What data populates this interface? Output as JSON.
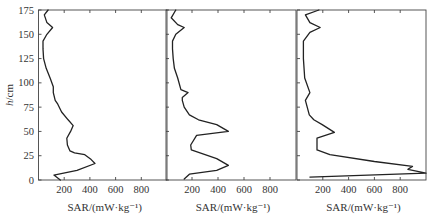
{
  "chart_data": {
    "type": "line",
    "layout": "three side-by-side panels sharing y-axis",
    "ylabel": "h/cm",
    "ylabel_italic_part": "h",
    "ylabel_unit_part": "/cm",
    "ylim": [
      0,
      175
    ],
    "yticks": [
      0,
      25,
      50,
      75,
      100,
      125,
      150,
      175
    ],
    "xlim": [
      0,
      1000
    ],
    "xticks": [
      200,
      400,
      600,
      800
    ],
    "grid": false,
    "legend": null,
    "panels": [
      {
        "xlabel": "SAR/(mW·kg⁻¹)",
        "series": [
          {
            "name": "panel-1",
            "points": [
              [
                170,
                0
              ],
              [
                120,
                5
              ],
              [
                300,
                10
              ],
              [
                440,
                17
              ],
              [
                410,
                21
              ],
              [
                360,
                26
              ],
              [
                280,
                28
              ],
              [
                245,
                30
              ],
              [
                225,
                36
              ],
              [
                220,
                43
              ],
              [
                250,
                50
              ],
              [
                270,
                56
              ],
              [
                230,
                62
              ],
              [
                180,
                70
              ],
              [
                150,
                78
              ],
              [
                130,
                82
              ],
              [
                115,
                90
              ],
              [
                115,
                96
              ],
              [
                90,
                105
              ],
              [
                60,
                115
              ],
              [
                40,
                125
              ],
              [
                35,
                135
              ],
              [
                35,
                143
              ],
              [
                65,
                150
              ],
              [
                110,
                157
              ],
              [
                65,
                162
              ],
              [
                45,
                170
              ],
              [
                75,
                175
              ]
            ]
          }
        ]
      },
      {
        "xlabel": "SAR/(mW·kg⁻¹)",
        "series": [
          {
            "name": "panel-2",
            "points": [
              [
                140,
                1
              ],
              [
                180,
                6
              ],
              [
                390,
                10
              ],
              [
                480,
                15
              ],
              [
                390,
                22
              ],
              [
                195,
                31
              ],
              [
                190,
                36
              ],
              [
                235,
                46
              ],
              [
                480,
                50
              ],
              [
                390,
                57
              ],
              [
                250,
                62
              ],
              [
                180,
                67
              ],
              [
                140,
                75
              ],
              [
                125,
                82
              ],
              [
                125,
                85
              ],
              [
                170,
                90
              ],
              [
                115,
                93
              ],
              [
                90,
                105
              ],
              [
                65,
                115
              ],
              [
                55,
                125
              ],
              [
                50,
                135
              ],
              [
                50,
                143
              ],
              [
                75,
                150
              ],
              [
                140,
                157
              ],
              [
                90,
                160
              ],
              [
                40,
                167
              ],
              [
                75,
                175
              ]
            ]
          }
        ]
      },
      {
        "xlabel": "SAR/(mW·kg⁻¹)",
        "series": [
          {
            "name": "panel-3",
            "points": [
              [
                100,
                3
              ],
              [
                1000,
                7
              ],
              [
                860,
                11
              ],
              [
                895,
                14
              ],
              [
                600,
                19
              ],
              [
                255,
                26
              ],
              [
                155,
                31
              ],
              [
                155,
                43
              ],
              [
                290,
                49
              ],
              [
                195,
                57
              ],
              [
                130,
                62
              ],
              [
                95,
                67
              ],
              [
                65,
                82
              ],
              [
                100,
                90
              ],
              [
                60,
                105
              ],
              [
                50,
                125
              ],
              [
                50,
                135
              ],
              [
                50,
                143
              ],
              [
                100,
                152
              ],
              [
                180,
                157
              ],
              [
                100,
                162
              ],
              [
                65,
                170
              ],
              [
                170,
                175
              ]
            ]
          }
        ]
      }
    ]
  },
  "axes": {
    "y_tick_labels": [
      "0",
      "25",
      "50",
      "75",
      "100",
      "125",
      "150",
      "175"
    ],
    "x_tick_labels": [
      "200",
      "400",
      "600",
      "800"
    ],
    "x_title": "SAR/(mW·kg⁻¹)"
  }
}
